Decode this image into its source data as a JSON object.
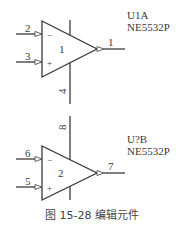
{
  "diagram": {
    "caption": "图 15-28    编辑元件",
    "colors": {
      "line": "#3a3a3a",
      "text": "#3a3a3a",
      "background": "#ffffff"
    },
    "components": [
      {
        "designator": "U1A",
        "part": "NE5532P",
        "part_number": "1",
        "inverting_pin": "2",
        "noninverting_pin": "3",
        "output_pin": "1",
        "power_pin": "4",
        "minus_sign": "−",
        "plus_sign": "+"
      },
      {
        "designator": "U?B",
        "part": "NE5532P",
        "part_number": "2",
        "inverting_pin": "6",
        "noninverting_pin": "5",
        "output_pin": "7",
        "power_pin": "8",
        "minus_sign": "−",
        "plus_sign": "+"
      }
    ]
  }
}
